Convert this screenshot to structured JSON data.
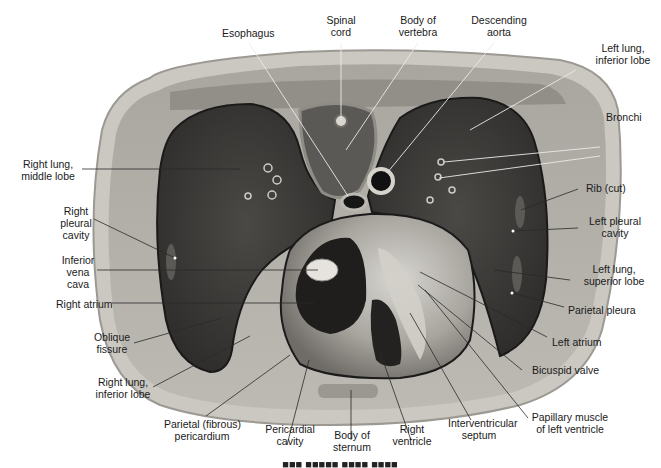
{
  "figure": {
    "kind": "anatomical cross-section of thorax",
    "colors": {
      "background": "#ffffff",
      "skin_outer": "#c9c6c0",
      "muscle_wall": "#8a8884",
      "lung": "#3e3d3a",
      "heart_light": "#bdbab4",
      "heart_dark": "#1e1d1b",
      "leader_line": "#2a2a2a",
      "leader_line_light": "#e8e8e8"
    }
  },
  "labels": {
    "esophagus": "Esophagus",
    "spinal_cord_1": "Spinal",
    "spinal_cord_2": "cord",
    "body_vertebra_1": "Body of",
    "body_vertebra_2": "vertebra",
    "desc_aorta_1": "Descending",
    "desc_aorta_2": "aorta",
    "left_lung_inf_1": "Left lung,",
    "left_lung_inf_2": "inferior lobe",
    "bronchi": "Bronchi",
    "right_lung_mid_1": "Right lung,",
    "right_lung_mid_2": "middle lobe",
    "rib_cut": "Rib (cut)",
    "right_pleural_1": "Right",
    "right_pleural_2": "pleural",
    "right_pleural_3": "cavity",
    "left_pleural_1": "Left pleural",
    "left_pleural_2": "cavity",
    "ivc_1": "Inferior",
    "ivc_2": "vena",
    "ivc_3": "cava",
    "left_lung_sup_1": "Left lung,",
    "left_lung_sup_2": "superior lobe",
    "right_atrium": "Right atrium",
    "parietal_pleura": "Parietal pleura",
    "oblique_fissure_1": "Oblique",
    "oblique_fissure_2": "fissure",
    "left_atrium": "Left atrium",
    "right_lung_inf_1": "Right lung,",
    "right_lung_inf_2": "inferior lobe",
    "bicuspid_valve": "Bicuspid valve",
    "parietal_pericardium_1": "Parietal (fibrous)",
    "parietal_pericardium_2": "pericardium",
    "pericardial_cavity_1": "Pericardial",
    "pericardial_cavity_2": "cavity",
    "body_sternum_1": "Body of",
    "body_sternum_2": "sternum",
    "right_ventricle_1": "Right",
    "right_ventricle_2": "ventricle",
    "interventricular_1": "Interventricular",
    "interventricular_2": "septum",
    "papillary_1": "Papillary muscle",
    "papillary_2": "of left ventricle"
  }
}
